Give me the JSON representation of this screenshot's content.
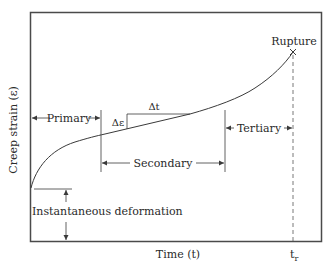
{
  "diagram": {
    "y_axis_label": "Creep strain (ε)",
    "x_axis_label": "Time (t)",
    "rupture_label": "Rupture",
    "rupture_time_label": "t",
    "rupture_time_subscript": "r",
    "stages": {
      "primary": "Primary",
      "secondary": "Secondary",
      "tertiary": "Tertiary"
    },
    "slope_labels": {
      "delta_strain": "Δε",
      "delta_time": "Δt"
    },
    "instantaneous_label": "Instantaneous deformation",
    "colors": {
      "line": "#3a3a3a",
      "frame": "#4a4a4a",
      "text": "#2a2a2a"
    }
  }
}
